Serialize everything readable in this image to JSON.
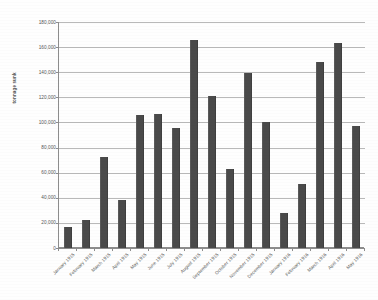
{
  "chart_data": {
    "type": "bar",
    "title": "",
    "xlabel": "",
    "ylabel": "tonnage sunk",
    "ylim": [
      0,
      180000
    ],
    "ytick_step": 20000,
    "grid": true,
    "legend": "none",
    "bar_color": "#4a4a4a",
    "ytick_labels": [
      "180,000",
      "160,000",
      "140,000",
      "120,000",
      "100,000",
      "80,000",
      "60,000",
      "40,000",
      "20,000",
      "0"
    ],
    "ytick_values": [
      180000,
      160000,
      140000,
      120000,
      100000,
      80000,
      60000,
      40000,
      20000,
      0
    ],
    "categories": [
      "January 1915",
      "February 1915",
      "March 1915",
      "April 1915",
      "May 1915",
      "June 1915",
      "July 1915",
      "August 1915",
      "September 1915",
      "October 1915",
      "November 1915",
      "December 1915",
      "January 1916",
      "February 1916",
      "March 1916",
      "April 1916",
      "May 1916"
    ],
    "values": [
      17000,
      22500,
      72500,
      38500,
      106000,
      107000,
      95500,
      166000,
      121000,
      63000,
      139500,
      100000,
      28000,
      51000,
      148500,
      163000,
      97500
    ]
  }
}
